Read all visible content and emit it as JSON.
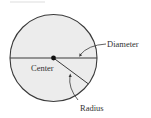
{
  "diagram": {
    "title": "",
    "shape": "circle",
    "colors": {
      "fill": "#ececec",
      "stroke": "#3a3a3a",
      "text": "#333333",
      "background": "#ffffff"
    },
    "labels": {
      "diameter": "Diameter",
      "center": "Center",
      "radius": "Radius"
    }
  }
}
